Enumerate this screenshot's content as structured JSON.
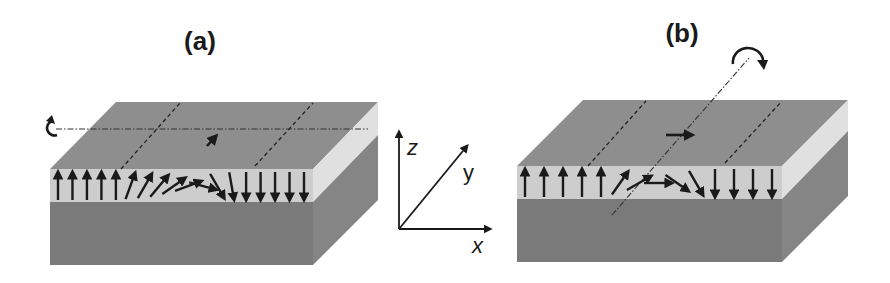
{
  "figure": {
    "panels": [
      {
        "label": "(a)",
        "rotation_axis": "x",
        "wall_type": "Bloch-like rotation about x axis",
        "front_moment_directions_deg": [
          90,
          90,
          90,
          90,
          90,
          70,
          60,
          50,
          35,
          20,
          -15,
          -60,
          -80,
          -90,
          -90,
          -90,
          -90,
          -90
        ],
        "top_center_arrow": "in-plane along y"
      },
      {
        "label": "(b)",
        "rotation_axis": "y",
        "wall_type": "Néel-like rotation about y axis",
        "front_moment_directions_deg": [
          90,
          90,
          90,
          90,
          90,
          55,
          30,
          0,
          -35,
          -60,
          -90,
          -90,
          -90,
          -90
        ],
        "top_center_arrow": "in-plane along x"
      }
    ],
    "axes": {
      "z": "z",
      "y": "y",
      "x": "x"
    },
    "colors": {
      "top_face": "#8e8e8e",
      "magnetic_layer": "#cdcdcd",
      "substrate": "#7a7a7a",
      "side_band": "#e0e0e0",
      "side_substrate": "#858585",
      "arrow": "#1a1a1a"
    }
  }
}
